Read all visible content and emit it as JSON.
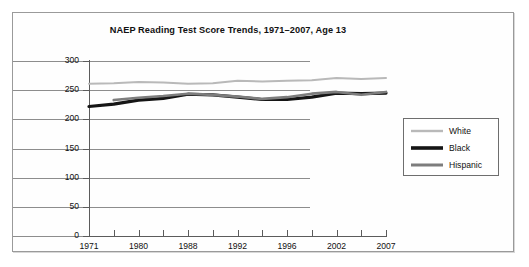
{
  "chart_data": {
    "type": "line",
    "title": "NAEP Reading Test Score Trends, 1971–2007, Age 13",
    "xlabel": "",
    "ylabel": "",
    "ylim": [
      0,
      300
    ],
    "yticks": [
      0,
      50,
      100,
      150,
      200,
      250,
      300
    ],
    "grid": true,
    "legend_position": "right",
    "x": [
      1971,
      1975,
      1980,
      1984,
      1988,
      1990,
      1992,
      1994,
      1996,
      1999,
      2002,
      2004,
      2007
    ],
    "xticklabels": [
      "1971",
      "",
      "1980",
      "",
      "1988",
      "",
      "1992",
      "",
      "1996",
      "",
      "2002",
      "",
      "2007"
    ],
    "labeled_ticks": [
      "1971",
      "1980",
      "1988",
      "1992",
      "1996",
      "2002",
      "2007"
    ],
    "series": [
      {
        "name": "White",
        "color": "#b9b9b9",
        "width": 2.0,
        "values": [
          261,
          262,
          264,
          263,
          261,
          262,
          266,
          265,
          266,
          267,
          271,
          269,
          271
        ]
      },
      {
        "name": "Black",
        "color": "#151515",
        "width": 3.2,
        "values": [
          222,
          226,
          233,
          236,
          243,
          242,
          238,
          234,
          234,
          238,
          245,
          244,
          245
        ]
      },
      {
        "name": "Hispanic",
        "color": "#7d7d7d",
        "width": 2.6,
        "values": [
          null,
          233,
          237,
          240,
          244,
          242,
          239,
          235,
          238,
          244,
          247,
          242,
          247
        ]
      }
    ]
  },
  "legend": {
    "items": [
      {
        "label": "White"
      },
      {
        "label": "Black"
      },
      {
        "label": "Hispanic"
      }
    ]
  },
  "colors": {
    "white_series": "#b9b9b9",
    "black_series": "#151515",
    "hispanic_series": "#7d7d7d",
    "gridline": "#8d8d8d",
    "axis": "#5b5b5b",
    "frame": "#9a9a9a",
    "text": "#111111",
    "background": "#ffffff"
  }
}
